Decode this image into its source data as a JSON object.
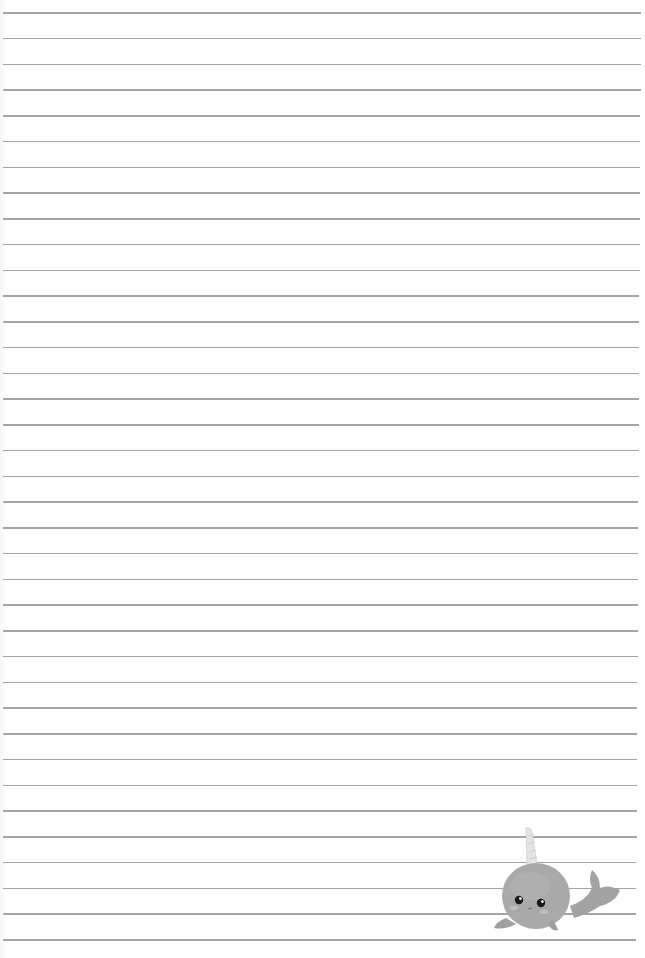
{
  "document": {
    "type": "lined writing paper",
    "orientation": "portrait",
    "background_color": "#fefefe",
    "rules": {
      "count": 37,
      "first_y": 12,
      "spacing": 25.75,
      "left_x": 3,
      "right_x_top": 641,
      "right_x_bottom": 636,
      "color": "#9a9a9a"
    },
    "decoration": {
      "name": "narwhal",
      "position": "bottom-right",
      "body_color": "#a8a8a8",
      "horn_color": "#e6e6e6",
      "eye_color": "#1a1a1a",
      "cheek_color": "#b5b5b5"
    }
  }
}
